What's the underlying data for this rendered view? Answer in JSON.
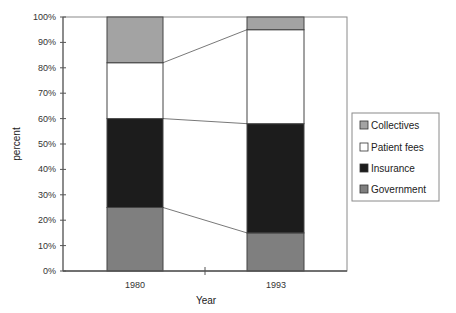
{
  "chart_data": {
    "type": "bar",
    "stacked": true,
    "percent_stacked": true,
    "title": "",
    "xlabel": "Year",
    "ylabel": "percent",
    "ylim": [
      0,
      100
    ],
    "yticks": [
      "0%",
      "10%",
      "20%",
      "30%",
      "40%",
      "50%",
      "60%",
      "70%",
      "80%",
      "90%",
      "100%"
    ],
    "categories": [
      "1980",
      "1993"
    ],
    "series": [
      {
        "name": "Government",
        "values": [
          25,
          15
        ],
        "color": "#7f7f7f"
      },
      {
        "name": "Insurance",
        "values": [
          35,
          43
        ],
        "color": "#1c1c1c"
      },
      {
        "name": "Patient fees",
        "values": [
          22,
          37
        ],
        "color": "#ffffff"
      },
      {
        "name": "Collectives",
        "values": [
          18,
          5
        ],
        "color": "#a3a3a3"
      }
    ],
    "connector_lines": true,
    "legend": {
      "position": "right",
      "entries": [
        "Collectives",
        "Patient fees",
        "Insurance",
        "Government"
      ]
    },
    "grid": false
  }
}
